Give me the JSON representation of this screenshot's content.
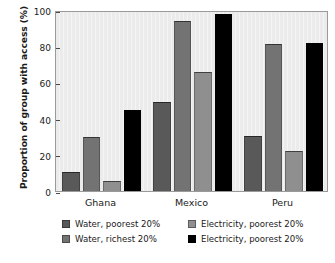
{
  "chart_data": {
    "type": "bar",
    "title": "",
    "xlabel": "",
    "ylabel": "Proportion of group with access (%)",
    "categories": [
      "Ghana",
      "Mexico",
      "Peru"
    ],
    "ylim": [
      0,
      100
    ],
    "yticks": [
      0,
      20,
      40,
      60,
      80,
      100
    ],
    "ytick_labels": [
      "0",
      "20",
      "40",
      "60",
      "80",
      "100"
    ],
    "grid": false,
    "legend_position": "below",
    "series": [
      {
        "name": "Water, poorest 20%",
        "color": "#595959",
        "values": [
          10.5,
          49.0,
          30.5
        ]
      },
      {
        "name": "Water, richest 20%",
        "color": "#737373",
        "values": [
          30.0,
          94.0,
          81.0
        ]
      },
      {
        "name": "Electricity, poorest 20%",
        "color": "#8f8f8f",
        "values": [
          5.5,
          65.5,
          22.0
        ]
      },
      {
        "name": "Electricity, poorest 20%",
        "color": "#000000",
        "values": [
          45.0,
          98.0,
          82.0
        ]
      }
    ]
  },
  "legend": {
    "items": [
      {
        "label": "Water, poorest 20%",
        "color": "#595959"
      },
      {
        "label": "Electricity, poorest 20%",
        "color": "#8f8f8f"
      },
      {
        "label": "Water, richest 20%",
        "color": "#737373"
      },
      {
        "label": "Electricity, poorest 20%",
        "color": "#000000"
      }
    ]
  },
  "plot_area": {
    "background": "#ebebeb",
    "border_color": "#9a9a9a"
  },
  "caption_fragment": ""
}
